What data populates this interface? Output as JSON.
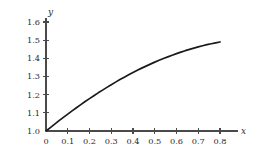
{
  "chart_data": {
    "type": "line",
    "title": "",
    "subtitle": "",
    "xlabel": "x",
    "ylabel": "y",
    "xlim": [
      0,
      0.85
    ],
    "ylim": [
      1.0,
      1.62
    ],
    "grid": false,
    "legend": null,
    "xticks": [
      0,
      0.1,
      0.2,
      0.3,
      0.4,
      0.5,
      0.6,
      0.7,
      0.8
    ],
    "xtick_labels": [
      "0",
      "0.1",
      "0.2",
      "0.3",
      "0.4",
      "0.5",
      "0.6",
      "0.7",
      "0.8"
    ],
    "yticks": [
      1.0,
      1.1,
      1.2,
      1.3,
      1.4,
      1.5,
      1.6
    ],
    "ytick_labels": [
      "1.0",
      "1.1",
      "1.2",
      "1.3",
      "1.4",
      "1.5",
      "1.6"
    ],
    "series": [
      {
        "name": "curve",
        "color": "#1a1a1a",
        "x": [
          0.0,
          0.02,
          0.04,
          0.06,
          0.08,
          0.1,
          0.12,
          0.14,
          0.16,
          0.18,
          0.2,
          0.22,
          0.24,
          0.26,
          0.28,
          0.3,
          0.32,
          0.34,
          0.36,
          0.38,
          0.4,
          0.42,
          0.44,
          0.46,
          0.48,
          0.5,
          0.52,
          0.54,
          0.56,
          0.58,
          0.6,
          0.62,
          0.64,
          0.66,
          0.68,
          0.7,
          0.72,
          0.74,
          0.76,
          0.78,
          0.8
        ],
        "y": [
          1.0,
          1.019,
          1.038,
          1.057,
          1.075,
          1.093,
          1.111,
          1.128,
          1.145,
          1.162,
          1.178,
          1.194,
          1.21,
          1.225,
          1.24,
          1.255,
          1.269,
          1.283,
          1.296,
          1.309,
          1.322,
          1.334,
          1.346,
          1.357,
          1.368,
          1.379,
          1.389,
          1.399,
          1.408,
          1.417,
          1.426,
          1.434,
          1.442,
          1.449,
          1.456,
          1.463,
          1.469,
          1.475,
          1.48,
          1.485,
          1.49
        ]
      }
    ],
    "axis_colors": {
      "axis": "#4a4a4a",
      "curve": "#1a1a1a",
      "text": "#2b2b2b",
      "background": "#ffffff"
    },
    "geometry": {
      "origin_x": 46,
      "origin_y": 131,
      "x_axis_end": 238,
      "y_axis_top": 18,
      "px_per_x_unit": 217.5,
      "px_per_y_unit": 181.7,
      "tick_len": 3
    }
  }
}
